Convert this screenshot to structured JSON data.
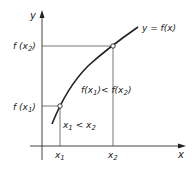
{
  "diagram": {
    "colors": {
      "ink": "#222222",
      "thin": "#555555",
      "background": "#ffffff"
    },
    "axes": {
      "x_label": "x",
      "y_label": "y"
    },
    "curve_label": "y = f(x)",
    "points": [
      {
        "x_label": "x",
        "x_sub": "1",
        "y_label": "f (x",
        "y_sub": "1",
        "y_close": ")"
      },
      {
        "x_label": "x",
        "x_sub": "2",
        "y_label": "f (x",
        "y_sub": "2",
        "y_close": ")"
      }
    ],
    "annotations": {
      "x_relation": {
        "a": "x",
        "a_sub": "1",
        "op": " < ",
        "b": "x",
        "b_sub": "2"
      },
      "f_relation": {
        "a": "f(x",
        "a_sub": "1",
        "mid": ")< f(x",
        "b_sub": "2",
        "end": ")"
      }
    }
  }
}
